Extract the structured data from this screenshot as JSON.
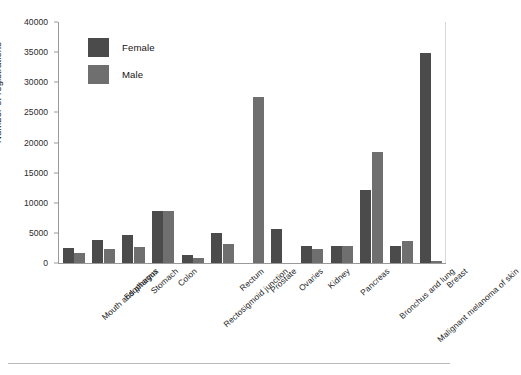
{
  "chart_data": {
    "type": "bar",
    "title": "",
    "xlabel": "",
    "ylabel": "Number of registrations",
    "ylim": [
      0,
      40000
    ],
    "ytick_step": 5000,
    "yticks": [
      "0",
      "5000",
      "10000",
      "15000",
      "20000",
      "25000",
      "30000",
      "35000",
      "40000"
    ],
    "grid": false,
    "legend_position": "upper-left-inside",
    "categories": [
      "Mouth and pharynx",
      "Esophagus",
      "Stomach",
      "Colon",
      "Rectosigmoid junction",
      "Rectum",
      "Prostate",
      "Ovaries",
      "Kidney",
      "Pancreas",
      "Bronchus and lung",
      "Malignant melanoma of skin",
      "Breast"
    ],
    "series": [
      {
        "name": "Female",
        "color": "#4b4b4b",
        "values": [
          2500,
          3800,
          4700,
          8600,
          1300,
          4900,
          0,
          5700,
          2800,
          2900,
          12100,
          2900,
          34800
        ]
      },
      {
        "name": "Male",
        "color": "#6f6f6f",
        "values": [
          1600,
          2400,
          2700,
          8600,
          900,
          3200,
          27500,
          0,
          2300,
          2900,
          18500,
          3600,
          300
        ]
      }
    ]
  },
  "legend": {
    "items": [
      {
        "label": "Female",
        "swatch": "female"
      },
      {
        "label": "Male",
        "swatch": "male"
      }
    ]
  },
  "colors": {
    "female": "#4b4b4b",
    "male": "#6f6f6f",
    "axis": "#9a9a9a",
    "text": "#141414",
    "background": "#ffffff"
  }
}
